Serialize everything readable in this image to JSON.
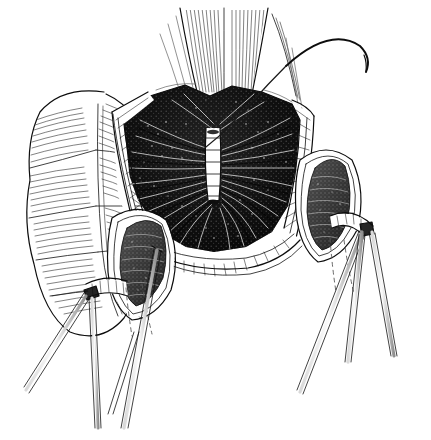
{
  "figure": {
    "title": "Opened bowel segment with everted wall flaps and stay sutures",
    "medium": "pen-and-ink line engraving",
    "background_color": "#ffffff",
    "ink_color": "#0d0d0d",
    "canvas": {
      "width": 431,
      "height": 440
    },
    "caption": "",
    "labels": [],
    "annotations": []
  },
  "anatomy": {
    "colon": {
      "name": "haustrated colon limb",
      "position": "left",
      "feature_names": [
        "haustra",
        "taenia coli",
        "serosal hatching"
      ],
      "haustra_count": 8
    },
    "proximal_limb": {
      "name": "proximal bowel limb",
      "position": "top-center",
      "feature_names": [
        "longitudinal hatching",
        "serosa"
      ]
    },
    "lumen": {
      "name": "opened bowel lumen",
      "shading": "dense stipple with radiating mucosal folds",
      "fold_count": 26,
      "fill_color": "#0d0d0d"
    },
    "suture_line": {
      "name": "posterior wall interrupted suture line",
      "orientation": "vertical",
      "stitch_count": 6
    },
    "wall_flaps": {
      "left_flap": "everted left bowel wall flap",
      "right_flap": "everted right bowel wall flap",
      "cut_edge": "full-thickness cut edge showing wall layers"
    },
    "side_pouches": {
      "left": "left everted mucosal pouch",
      "right": "right everted mucosal pouch"
    }
  },
  "instruments": {
    "needle": {
      "name": "curved surgical needle",
      "position": "upper-right",
      "curve": "半 arc"
    },
    "suture_thread": {
      "name": "suture thread",
      "path": "from needle down across serosa into lumen"
    },
    "clamps": [
      {
        "name": "left stay-suture clamp",
        "shaft_count": 2,
        "position": "lower-left"
      },
      {
        "name": "left traction clamp",
        "shaft_count": 2,
        "position": "bottom-center-left"
      },
      {
        "name": "right stay-suture clamp",
        "shaft_count": 2,
        "position": "lower-right"
      },
      {
        "name": "right traction clamp",
        "shaft_count": 2,
        "position": "bottom-right"
      }
    ],
    "hidden_lines": {
      "name": "dashed hidden outline",
      "style": "dashed",
      "count": 4
    }
  }
}
